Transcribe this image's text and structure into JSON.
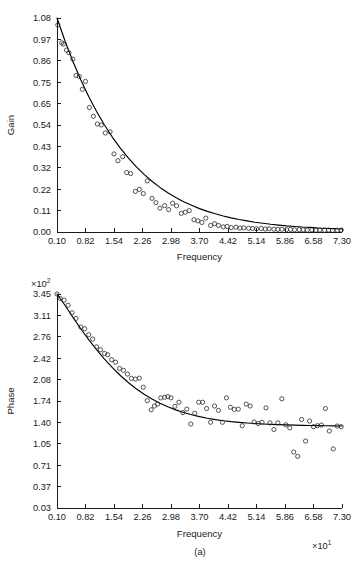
{
  "figure": {
    "caption": "(a)",
    "background_color": "#ffffff",
    "ink_color": "#1a1a1a",
    "curve_color": "#000000",
    "marker_color": "#2a2a2a"
  },
  "chart_data": [
    {
      "type": "scatter",
      "name": "gain-plot",
      "title": "",
      "xlabel": "Frequency",
      "ylabel": "Gain",
      "x_exponent_label": "",
      "y_exponent_label": "",
      "grid": false,
      "legend": "none",
      "xlim": [
        0.1,
        7.3
      ],
      "ylim": [
        0.0,
        1.08
      ],
      "xticks": [
        "0.10",
        "0.82",
        "1.54",
        "2.26",
        "2.98",
        "3.70",
        "4.42",
        "5.14",
        "5.86",
        "6.58",
        "7.30"
      ],
      "yticks": [
        "0.00",
        "0.11",
        "0.22",
        "0.32",
        "0.43",
        "0.54",
        "0.65",
        "0.75",
        "0.86",
        "0.97",
        "1.08"
      ],
      "series": [
        {
          "name": "fitted-curve",
          "style": "line",
          "x": [
            0.1,
            0.3,
            0.5,
            0.7,
            0.9,
            1.1,
            1.3,
            1.5,
            1.7,
            1.9,
            2.1,
            2.3,
            2.5,
            2.7,
            2.9,
            3.1,
            3.3,
            3.5,
            3.7,
            3.9,
            4.1,
            4.3,
            4.5,
            4.7,
            4.9,
            5.1,
            5.3,
            5.5,
            5.7,
            5.9,
            6.1,
            6.3,
            6.5,
            6.7,
            6.9,
            7.1,
            7.3
          ],
          "y": [
            1.08,
            0.965,
            0.862,
            0.768,
            0.684,
            0.608,
            0.54,
            0.478,
            0.423,
            0.374,
            0.33,
            0.291,
            0.256,
            0.225,
            0.198,
            0.174,
            0.153,
            0.135,
            0.118,
            0.104,
            0.092,
            0.081,
            0.071,
            0.063,
            0.056,
            0.049,
            0.044,
            0.039,
            0.035,
            0.031,
            0.028,
            0.025,
            0.023,
            0.02,
            0.018,
            0.017,
            0.015
          ]
        },
        {
          "name": "measured-points",
          "style": "open-circle",
          "x": [
            0.12,
            0.22,
            0.26,
            0.34,
            0.4,
            0.5,
            0.58,
            0.66,
            0.74,
            0.82,
            0.92,
            1.02,
            1.12,
            1.22,
            1.32,
            1.44,
            1.54,
            1.64,
            1.76,
            1.86,
            1.96,
            2.08,
            2.18,
            2.28,
            2.38,
            2.5,
            2.6,
            2.7,
            2.82,
            2.92,
            3.02,
            3.12,
            3.24,
            3.34,
            3.44,
            3.56,
            3.66,
            3.76,
            3.86,
            3.98,
            4.08,
            4.18,
            4.3,
            4.4,
            4.5,
            4.62,
            4.72,
            4.82,
            4.94,
            5.04,
            5.14,
            5.26,
            5.36,
            5.46,
            5.58,
            5.68,
            5.78,
            5.9,
            6.0,
            6.1,
            6.22,
            6.32,
            6.42,
            6.54,
            6.64,
            6.74,
            6.86,
            6.96,
            7.06,
            7.18,
            7.28
          ],
          "y": [
            1.045,
            0.955,
            0.948,
            0.918,
            0.905,
            0.872,
            0.79,
            0.785,
            0.72,
            0.76,
            0.628,
            0.584,
            0.545,
            0.54,
            0.5,
            0.506,
            0.394,
            0.36,
            0.38,
            0.3,
            0.295,
            0.205,
            0.215,
            0.194,
            0.258,
            0.17,
            0.148,
            0.12,
            0.133,
            0.113,
            0.145,
            0.132,
            0.094,
            0.1,
            0.108,
            0.062,
            0.056,
            0.048,
            0.07,
            0.033,
            0.042,
            0.033,
            0.026,
            0.028,
            0.022,
            0.024,
            0.02,
            0.021,
            0.019,
            0.018,
            0.016,
            0.018,
            0.015,
            0.016,
            0.014,
            0.013,
            0.014,
            0.012,
            0.013,
            0.011,
            0.012,
            0.011,
            0.01,
            0.011,
            0.009,
            0.01,
            0.009,
            0.01,
            0.008,
            0.009,
            0.01
          ]
        }
      ]
    },
    {
      "type": "scatter",
      "name": "phase-plot",
      "title": "",
      "xlabel": "Frequency",
      "ylabel": "Phase",
      "x_exponent_label": "×10¹",
      "y_exponent_label": "×10²",
      "x_exponent_base": "×10",
      "x_exponent_power": "1",
      "y_exponent_base": "×10",
      "y_exponent_power": "2",
      "grid": false,
      "legend": "none",
      "xlim": [
        0.1,
        7.3
      ],
      "ylim": [
        0.03,
        3.45
      ],
      "xticks": [
        "0.10",
        "0.82",
        "1.54",
        "2.26",
        "2.98",
        "3.70",
        "4.42",
        "5.14",
        "5.86",
        "6.58",
        "7.30"
      ],
      "yticks": [
        "0.03",
        "0.37",
        "0.71",
        "1.05",
        "1.40",
        "1.74",
        "2.08",
        "2.42",
        "2.76",
        "3.11",
        "3.45"
      ],
      "series": [
        {
          "name": "fitted-curve",
          "style": "line",
          "x": [
            0.1,
            0.3,
            0.5,
            0.7,
            0.9,
            1.1,
            1.3,
            1.5,
            1.7,
            1.9,
            2.1,
            2.3,
            2.5,
            2.7,
            2.9,
            3.1,
            3.3,
            3.5,
            3.7,
            3.9,
            4.1,
            4.3,
            4.5,
            4.7,
            4.9,
            5.1,
            5.3,
            5.5,
            5.7,
            5.9,
            6.1,
            6.3,
            6.5,
            6.7,
            6.9,
            7.1,
            7.3
          ],
          "y": [
            3.45,
            3.27,
            3.08,
            2.895,
            2.72,
            2.56,
            2.41,
            2.272,
            2.148,
            2.036,
            1.936,
            1.848,
            1.772,
            1.705,
            1.648,
            1.598,
            1.556,
            1.52,
            1.49,
            1.464,
            1.443,
            1.425,
            1.41,
            1.398,
            1.388,
            1.38,
            1.373,
            1.367,
            1.362,
            1.358,
            1.354,
            1.351,
            1.348,
            1.346,
            1.344,
            1.342,
            1.34
          ]
        },
        {
          "name": "measured-points",
          "style": "open-circle",
          "x": [
            0.1,
            0.18,
            0.28,
            0.38,
            0.48,
            0.58,
            0.7,
            0.8,
            0.9,
            1.0,
            1.1,
            1.2,
            1.3,
            1.38,
            1.48,
            1.58,
            1.68,
            1.78,
            1.88,
            1.98,
            2.08,
            2.18,
            2.28,
            2.38,
            2.48,
            2.56,
            2.64,
            2.72,
            2.82,
            2.9,
            2.98,
            3.08,
            3.18,
            3.28,
            3.38,
            3.48,
            3.58,
            3.68,
            3.78,
            3.88,
            3.98,
            4.08,
            4.18,
            4.28,
            4.38,
            4.48,
            4.58,
            4.68,
            4.78,
            4.88,
            4.98,
            5.08,
            5.18,
            5.28,
            5.38,
            5.48,
            5.58,
            5.68,
            5.78,
            5.88,
            5.98,
            6.08,
            6.18,
            6.28,
            6.38,
            6.48,
            6.58,
            6.68,
            6.78,
            6.88,
            6.98,
            7.08,
            7.18,
            7.28
          ],
          "y": [
            3.45,
            3.38,
            3.352,
            3.27,
            3.15,
            3.06,
            2.922,
            2.895,
            2.8,
            2.73,
            2.605,
            2.56,
            2.5,
            2.48,
            2.4,
            2.36,
            2.26,
            2.23,
            2.17,
            2.1,
            2.09,
            2.105,
            1.96,
            1.745,
            1.6,
            1.66,
            1.69,
            1.79,
            1.8,
            1.81,
            1.79,
            1.655,
            1.72,
            1.555,
            1.61,
            1.372,
            1.545,
            1.72,
            1.72,
            1.62,
            1.4,
            1.66,
            1.59,
            1.4,
            1.79,
            1.64,
            1.605,
            1.61,
            1.345,
            1.69,
            1.66,
            1.405,
            1.38,
            1.4,
            1.63,
            1.39,
            1.285,
            1.39,
            1.775,
            1.36,
            1.31,
            0.925,
            0.855,
            1.445,
            1.1,
            1.42,
            1.33,
            1.345,
            1.355,
            1.62,
            1.26,
            0.975,
            1.34,
            1.33
          ]
        }
      ]
    }
  ]
}
